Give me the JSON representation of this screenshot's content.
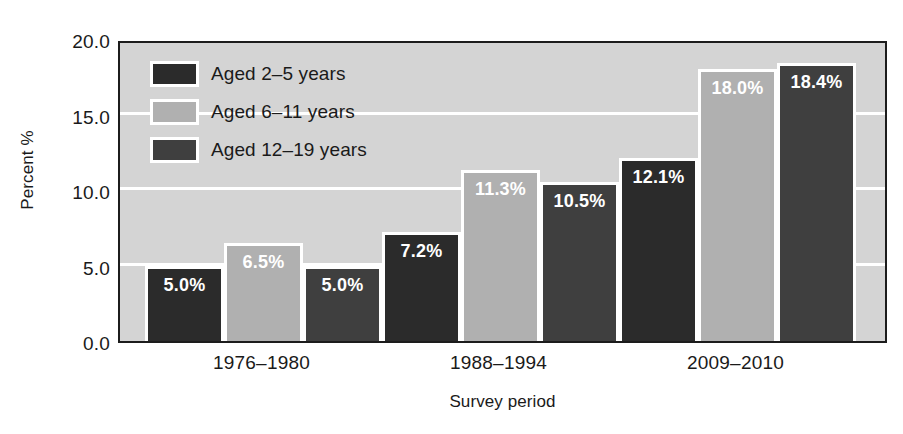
{
  "chart_data": {
    "type": "bar",
    "title": "",
    "subtitle": "",
    "xlabel": "Survey period",
    "ylabel": "Percent %",
    "categories": [
      "1976–1980",
      "1988–1994",
      "2009–2010"
    ],
    "series": [
      {
        "name": "Aged 2–5 years",
        "color": "#2b2b2b",
        "values": [
          5.0,
          7.2,
          12.1
        ],
        "labels": [
          "5.0%",
          "7.2%",
          "12.1%"
        ]
      },
      {
        "name": "Aged 6–11 years",
        "color": "#b0b0b0",
        "values": [
          6.5,
          11.3,
          18.0
        ],
        "labels": [
          "6.5%",
          "11.3%",
          "18.0%"
        ]
      },
      {
        "name": "Aged 12–19 years",
        "color": "#3f3f3f",
        "values": [
          5.0,
          10.5,
          18.4
        ],
        "labels": [
          "5.0%",
          "10.5%",
          "18.4%"
        ]
      }
    ],
    "ylim": [
      0.0,
      20.0
    ],
    "ytick_labels": [
      "20.0",
      "15.0",
      "10.0",
      "5.0",
      "0.0"
    ],
    "ytick_values": [
      20.0,
      15.0,
      10.0,
      5.0,
      0.0
    ],
    "gridlines": [
      15.0,
      10.0,
      5.0
    ],
    "grid": true,
    "grid_color": "#ffffff",
    "plot_background": "#d4d4d4",
    "axis_color": "#1c1c1c",
    "bar_outline_color": "#ffffff",
    "data_label_color": "#ffffff",
    "legend_position": "top-left"
  },
  "legend": {
    "items": [
      {
        "label": "Aged 2–5 years",
        "color": "#2b2b2b"
      },
      {
        "label": "Aged 6–11 years",
        "color": "#b0b0b0"
      },
      {
        "label": "Aged 12–19 years",
        "color": "#3f3f3f"
      }
    ]
  }
}
